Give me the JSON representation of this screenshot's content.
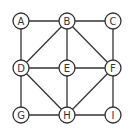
{
  "graph": {
    "nodes": [
      {
        "id": "A",
        "label": "A",
        "x": 21,
        "y": 21
      },
      {
        "id": "B",
        "label": "B",
        "x": 67,
        "y": 21
      },
      {
        "id": "C",
        "label": "C",
        "x": 113,
        "y": 21
      },
      {
        "id": "D",
        "label": "D",
        "x": 21,
        "y": 68
      },
      {
        "id": "E",
        "label": "E",
        "x": 67,
        "y": 68
      },
      {
        "id": "F",
        "label": "F",
        "x": 113,
        "y": 68
      },
      {
        "id": "G",
        "label": "G",
        "x": 21,
        "y": 115
      },
      {
        "id": "H",
        "label": "H",
        "x": 67,
        "y": 115
      },
      {
        "id": "I",
        "label": "I",
        "x": 113,
        "y": 115
      }
    ],
    "edges": [
      [
        "A",
        "B"
      ],
      [
        "B",
        "C"
      ],
      [
        "A",
        "D"
      ],
      [
        "C",
        "F"
      ],
      [
        "B",
        "D"
      ],
      [
        "B",
        "E"
      ],
      [
        "B",
        "F"
      ],
      [
        "D",
        "E"
      ],
      [
        "E",
        "F"
      ],
      [
        "D",
        "G"
      ],
      [
        "D",
        "H"
      ],
      [
        "E",
        "H"
      ],
      [
        "F",
        "H"
      ],
      [
        "F",
        "I"
      ],
      [
        "G",
        "H"
      ],
      [
        "H",
        "I"
      ]
    ],
    "node_radius": 8,
    "colors": {
      "stroke": "#333333",
      "fill": "#ffffff"
    }
  }
}
